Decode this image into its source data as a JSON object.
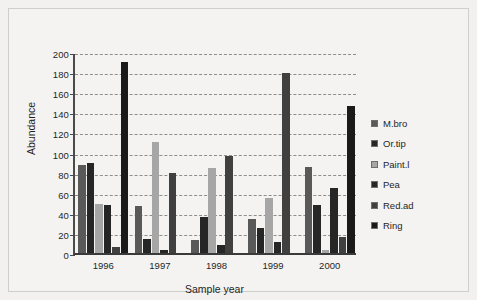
{
  "chart_data": {
    "type": "bar",
    "title": "",
    "xlabel": "Sample year",
    "ylabel": "Abundance",
    "categories": [
      "1996",
      "1997",
      "1998",
      "1999",
      "2000"
    ],
    "ylim": [
      0,
      200
    ],
    "yticks": [
      0,
      20,
      40,
      60,
      80,
      100,
      120,
      140,
      160,
      180,
      200
    ],
    "grid": true,
    "legend_position": "right",
    "series": [
      {
        "name": "M.bro",
        "color": "#595959",
        "values": [
          88,
          47,
          13,
          34,
          86
        ]
      },
      {
        "name": "Or.tip",
        "color": "#262626",
        "values": [
          90,
          14,
          36,
          25,
          48
        ]
      },
      {
        "name": "Paint.l",
        "color": "#a6a6a6",
        "values": [
          49,
          110,
          85,
          55,
          3
        ]
      },
      {
        "name": "Pea",
        "color": "#262626",
        "values": [
          48,
          3,
          8,
          11,
          65
        ]
      },
      {
        "name": "Red.ad",
        "color": "#404040",
        "values": [
          6,
          80,
          97,
          179,
          16
        ]
      },
      {
        "name": "Ring",
        "color": "#1a1a1a",
        "values": [
          190,
          0,
          0,
          0,
          146
        ]
      }
    ]
  }
}
